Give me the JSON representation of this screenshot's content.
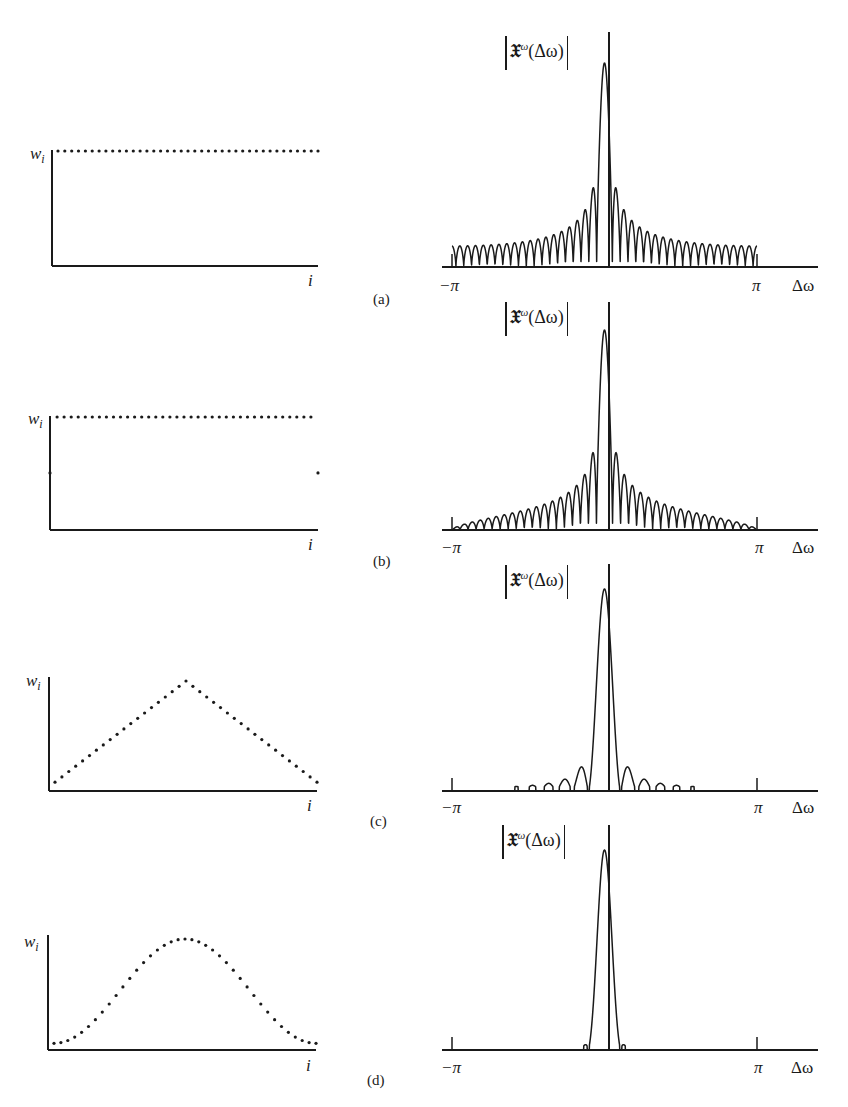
{
  "figure": {
    "panels": [
      {
        "id": "a",
        "caption": "(a)",
        "window": "rectangular",
        "y_label": "w",
        "y_sub": "i",
        "x_label": "i",
        "spectrum_label": {
          "frak": "𝔛",
          "sup": "ω",
          "arg": "(Δω)"
        },
        "spectrum_ticks": [
          "−π",
          "π"
        ],
        "spectrum_xlabel": "Δω"
      },
      {
        "id": "b",
        "caption": "(b)",
        "window": "rectangular with half-weight endpoints",
        "y_label": "w",
        "y_sub": "i",
        "x_label": "i",
        "spectrum_label": {
          "frak": "𝔛",
          "sup": "ω",
          "arg": "(Δω)"
        },
        "spectrum_ticks": [
          "−π",
          "π"
        ],
        "spectrum_xlabel": "Δω"
      },
      {
        "id": "c",
        "caption": "(c)",
        "window": "triangular",
        "y_label": "w",
        "y_sub": "i",
        "x_label": "i",
        "spectrum_label": {
          "frak": "𝔛",
          "sup": "ω",
          "arg": "(Δω)"
        },
        "spectrum_ticks": [
          "−π",
          "π"
        ],
        "spectrum_xlabel": "Δω"
      },
      {
        "id": "d",
        "caption": "(d)",
        "window": "raised cosine",
        "y_label": "w",
        "y_sub": "i",
        "x_label": "i",
        "spectrum_label": {
          "frak": "𝔛",
          "sup": "ω",
          "arg": "(Δω)"
        },
        "spectrum_ticks": [
          "−π",
          "π"
        ],
        "spectrum_xlabel": "Δω"
      }
    ]
  },
  "chart_data": [
    {
      "type": "scatter",
      "title": "(a) window weights",
      "xlabel": "i",
      "ylabel": "w_i",
      "n_points": 39,
      "shape": "constant",
      "values": "all equal to 1"
    },
    {
      "type": "line",
      "title": "(a) |X^ω(Δω)|",
      "xlabel": "Δω",
      "ylabel": "|X^ω(Δω)|",
      "xlim": [
        "−π",
        "π"
      ],
      "mainlobe": "narrow",
      "sidelobes": "slowly decaying, many"
    },
    {
      "type": "scatter",
      "title": "(b) window weights",
      "xlabel": "i",
      "ylabel": "w_i",
      "n_points": 39,
      "shape": "constant with endpoints at 0.5",
      "values": "1 inside, 0.5 at ends"
    },
    {
      "type": "line",
      "title": "(b) |X^ω(Δω)|",
      "xlabel": "Δω",
      "ylabel": "|X^ω(Δω)|",
      "xlim": [
        "−π",
        "π"
      ],
      "mainlobe": "narrow",
      "sidelobes": "decay faster than (a)"
    },
    {
      "type": "scatter",
      "title": "(c) window weights",
      "xlabel": "i",
      "ylabel": "w_i",
      "n_points": 39,
      "shape": "triangular",
      "values": "linearly rising to peak at center then falling"
    },
    {
      "type": "line",
      "title": "(c) |X^ω(Δω)|",
      "xlabel": "Δω",
      "ylabel": "|X^ω(Δω)|",
      "xlim": [
        "−π",
        "π"
      ],
      "mainlobe": "wider",
      "sidelobes": "few, small"
    },
    {
      "type": "scatter",
      "title": "(d) window weights",
      "xlabel": "i",
      "ylabel": "w_i",
      "n_points": 39,
      "shape": "raised cosine",
      "values": "bell-shaped, near zero at ends"
    },
    {
      "type": "line",
      "title": "(d) |X^ω(Δω)|",
      "xlabel": "Δω",
      "ylabel": "|X^ω(Δω)|",
      "xlim": [
        "−π",
        "π"
      ],
      "mainlobe": "widest",
      "sidelobes": "negligible"
    }
  ]
}
